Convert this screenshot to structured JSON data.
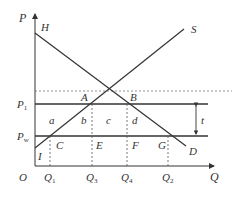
{
  "diagram": {
    "title": "",
    "axes": {
      "y_label": "P",
      "x_label": "Q",
      "origin_label": "O"
    },
    "curves": {
      "demand": {
        "start_label": "H",
        "end_label": "D"
      },
      "supply": {
        "end_label": "S"
      }
    },
    "price_levels": {
      "p1": {
        "main": "P",
        "sub": "1"
      },
      "pw": {
        "main": "P",
        "sub": "w"
      }
    },
    "points": {
      "A": "A",
      "B": "B",
      "C": "C",
      "E": "E",
      "F": "F",
      "G": "G",
      "I": "I"
    },
    "areas": {
      "a": "a",
      "b": "b",
      "c": "c",
      "d": "d"
    },
    "tariff_label": "t",
    "quantities": [
      {
        "main": "Q",
        "sub": "1"
      },
      {
        "main": "Q",
        "sub": "3"
      },
      {
        "main": "Q",
        "sub": "4"
      },
      {
        "main": "Q",
        "sub": "2"
      }
    ],
    "colors": {
      "line": "#333333",
      "dashed": "#555555",
      "background": "#ffffff"
    }
  }
}
